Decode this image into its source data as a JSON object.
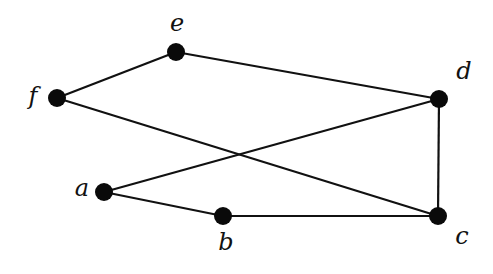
{
  "graph": {
    "nodes": [
      {
        "id": "a",
        "label": "a",
        "x": 104,
        "y": 192,
        "lx": 82,
        "ly": 196
      },
      {
        "id": "b",
        "label": "b",
        "x": 223,
        "y": 216,
        "lx": 226,
        "ly": 250
      },
      {
        "id": "c",
        "label": "c",
        "x": 438,
        "y": 216,
        "lx": 462,
        "ly": 244
      },
      {
        "id": "d",
        "label": "d",
        "x": 439,
        "y": 99,
        "lx": 464,
        "ly": 79
      },
      {
        "id": "e",
        "label": "e",
        "x": 176,
        "y": 52,
        "lx": 177,
        "ly": 31
      },
      {
        "id": "f",
        "label": "f",
        "x": 57,
        "y": 98,
        "lx": 33,
        "ly": 104
      }
    ],
    "edges": [
      [
        "f",
        "e"
      ],
      [
        "e",
        "d"
      ],
      [
        "f",
        "c"
      ],
      [
        "a",
        "d"
      ],
      [
        "a",
        "b"
      ],
      [
        "b",
        "c"
      ],
      [
        "d",
        "c"
      ]
    ],
    "node_radius": 9,
    "colors": {
      "node": "#0a0a0a",
      "edge": "#111111",
      "background": "#ffffff"
    }
  }
}
